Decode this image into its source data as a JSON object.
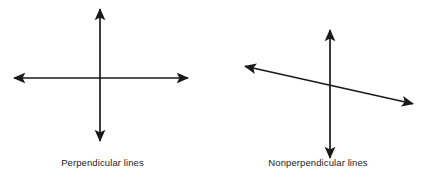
{
  "figure": {
    "background_color": "#ffffff",
    "line_color": "#1a1a1a",
    "panels": [
      {
        "id": "perpendicular",
        "caption": "Perpendicular lines",
        "lines": [
          {
            "name": "vertical-line",
            "arrowheads": "both",
            "x1": 100,
            "y1": 8,
            "x2": 100,
            "y2": 142
          },
          {
            "name": "horizontal-line",
            "arrowheads": "both",
            "x1": 13,
            "y1": 78,
            "x2": 189,
            "y2": 78
          }
        ],
        "intersection": {
          "x": 100,
          "y": 78
        },
        "angle_between_lines_deg": 90
      },
      {
        "id": "nonperpendicular",
        "caption": "Nonperpendicular lines",
        "lines": [
          {
            "name": "vertical-line",
            "arrowheads": "both",
            "x1": 330,
            "y1": 29,
            "x2": 330,
            "y2": 159
          },
          {
            "name": "slanted-line",
            "arrowheads": "both",
            "x1": 244,
            "y1": 66,
            "x2": 414,
            "y2": 104
          }
        ],
        "intersection": {
          "x": 330,
          "y": 87
        },
        "angle_between_lines_deg": 77
      }
    ]
  },
  "chart_data": {
    "type": "diagram",
    "title": "",
    "items": [
      {
        "label": "Perpendicular lines",
        "description": "Two straight double-headed lines crossing at right angles",
        "angle_deg": 90
      },
      {
        "label": "Nonperpendicular lines",
        "description": "A vertical double-headed line crossed by a slanted double-headed line at an oblique angle",
        "angle_deg": 77
      }
    ]
  }
}
